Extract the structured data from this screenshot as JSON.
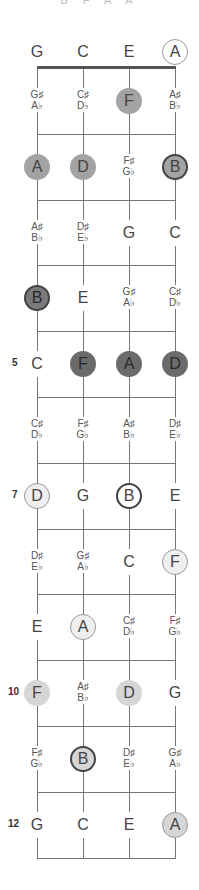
{
  "caption": "B F A A",
  "strings": [
    "G",
    "C",
    "E",
    "A"
  ],
  "colors": {
    "white": "#ffffff",
    "very_light": "#efefef",
    "light": "#d6d6d6",
    "medium": "#a3a3a3",
    "dark": "#7a7a7a",
    "darker": "#6b6b6b",
    "line": "#777777"
  },
  "fret_numbers": [
    {
      "fret": 5,
      "label": "5"
    },
    {
      "fret": 7,
      "label": "7"
    },
    {
      "fret": 10,
      "label": "10"
    },
    {
      "fret": 12,
      "label": "12"
    }
  ],
  "rows": [
    {
      "fret": 0,
      "notes": [
        {
          "t": "G"
        },
        {
          "t": "C"
        },
        {
          "t": "E"
        },
        {
          "t": "A",
          "fill": "white",
          "ring": "circle"
        }
      ]
    },
    {
      "fret": 1,
      "notes": [
        {
          "t": "G♯",
          "b": "A♭"
        },
        {
          "t": "C♯",
          "b": "D♭"
        },
        {
          "t": "F",
          "fill": "medium"
        },
        {
          "t": "A♯",
          "b": "B♭"
        }
      ]
    },
    {
      "fret": 2,
      "notes": [
        {
          "t": "A",
          "fill": "medium"
        },
        {
          "t": "D",
          "fill": "medium"
        },
        {
          "t": "F♯",
          "b": "G♭"
        },
        {
          "t": "B",
          "fill": "medium",
          "ring": "strong"
        }
      ]
    },
    {
      "fret": 3,
      "notes": [
        {
          "t": "A♯",
          "b": "B♭"
        },
        {
          "t": "D♯",
          "b": "E♭"
        },
        {
          "t": "G"
        },
        {
          "t": "C"
        }
      ]
    },
    {
      "fret": 4,
      "notes": [
        {
          "t": "B",
          "fill": "dark",
          "ring": "strong"
        },
        {
          "t": "E"
        },
        {
          "t": "G♯",
          "b": "A♭"
        },
        {
          "t": "C♯",
          "b": "D♭"
        }
      ]
    },
    {
      "fret": 5,
      "notes": [
        {
          "t": "C"
        },
        {
          "t": "F",
          "fill": "darker"
        },
        {
          "t": "A",
          "fill": "darker"
        },
        {
          "t": "D",
          "fill": "darker"
        }
      ]
    },
    {
      "fret": 6,
      "notes": [
        {
          "t": "C♯",
          "b": "D♭"
        },
        {
          "t": "F♯",
          "b": "G♭"
        },
        {
          "t": "A♯",
          "b": "B♭"
        },
        {
          "t": "D♯",
          "b": "E♭"
        }
      ]
    },
    {
      "fret": 7,
      "notes": [
        {
          "t": "D",
          "fill": "very_light",
          "ring": "circle"
        },
        {
          "t": "G"
        },
        {
          "t": "B",
          "fill": "white",
          "ring": "strong"
        },
        {
          "t": "E"
        }
      ]
    },
    {
      "fret": 8,
      "notes": [
        {
          "t": "D♯",
          "b": "E♭"
        },
        {
          "t": "G♯",
          "b": "A♭"
        },
        {
          "t": "C"
        },
        {
          "t": "F",
          "fill": "very_light",
          "ring": "circle"
        }
      ]
    },
    {
      "fret": 9,
      "notes": [
        {
          "t": "E"
        },
        {
          "t": "A",
          "fill": "very_light",
          "ring": "circle"
        },
        {
          "t": "C♯",
          "b": "D♭"
        },
        {
          "t": "F♯",
          "b": "G♭"
        }
      ]
    },
    {
      "fret": 10,
      "notes": [
        {
          "t": "F",
          "fill": "light"
        },
        {
          "t": "A♯",
          "b": "B♭"
        },
        {
          "t": "D",
          "fill": "light"
        },
        {
          "t": "G"
        }
      ]
    },
    {
      "fret": 11,
      "notes": [
        {
          "t": "F♯",
          "b": "G♭"
        },
        {
          "t": "B",
          "fill": "light",
          "ring": "strong"
        },
        {
          "t": "D♯",
          "b": "E♭"
        },
        {
          "t": "G♯",
          "b": "A♭"
        }
      ]
    },
    {
      "fret": 12,
      "notes": [
        {
          "t": "G"
        },
        {
          "t": "C"
        },
        {
          "t": "E"
        },
        {
          "t": "A",
          "fill": "light",
          "ring": "circle"
        }
      ]
    }
  ]
}
